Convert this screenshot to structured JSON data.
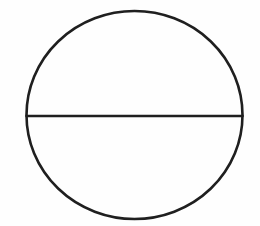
{
  "figure": {
    "name": "circle-divided-in-half",
    "canvas": {
      "width": 260,
      "height": 226,
      "background_color": "#fefefe"
    },
    "stroke": {
      "color": "#1f1f1f",
      "width": 2.6,
      "linecap": "round"
    },
    "circle": {
      "center_x": 134.5,
      "center_y": 115,
      "radius_x": 108,
      "radius_y": 104,
      "fill": "none"
    },
    "diameter_line": {
      "orientation": "horizontal",
      "x1": 26.5,
      "y1": 116,
      "x2": 242.5,
      "y2": 116
    },
    "regions": [
      {
        "label": "upper-half",
        "position": "top"
      },
      {
        "label": "lower-half",
        "position": "bottom"
      }
    ],
    "labels": []
  }
}
